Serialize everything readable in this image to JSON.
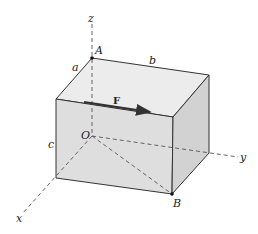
{
  "diagram": {
    "labels": {
      "z": "z",
      "y": "y",
      "x": "x",
      "A": "A",
      "B": "B",
      "O": "O",
      "a": "a",
      "b": "b",
      "c": "c",
      "F": "F"
    },
    "colors": {
      "top_face": "#ebebeb",
      "front_face": "#dedede",
      "right_face": "#d2d2d2",
      "edge": "#333333",
      "dash": "#555555",
      "arrow": "#333333"
    }
  }
}
